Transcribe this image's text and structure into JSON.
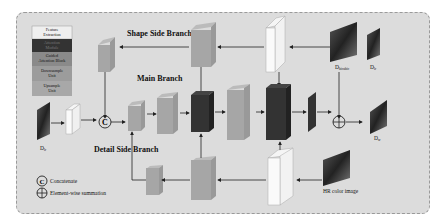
{
  "legend": {
    "items": [
      {
        "label_lines": [
          "Feature",
          "Extraction"
        ],
        "color": "#efefef",
        "text_color": "#111111"
      },
      {
        "label_lines": [
          "Attention",
          "Module"
        ],
        "color": "#333333",
        "text_color": "#777777"
      },
      {
        "label_lines": [
          "Guided",
          "Attention Block"
        ],
        "color": "#8a8a8a",
        "text_color": "#111111"
      },
      {
        "label_lines": [
          "Downsample",
          "Unit"
        ],
        "color": "#9c9c9c",
        "text_color": "#111111"
      },
      {
        "label_lines": [
          "Upsample",
          "Unit"
        ],
        "color": "#a8a8a8",
        "text_color": "#111111"
      }
    ]
  },
  "branches": {
    "shape": "Shape Side Branch",
    "main": "Main Branch",
    "detail": "Detail Side Branch"
  },
  "images": {
    "input": "D",
    "input_sub": "lr",
    "bicubic": "D",
    "bicubic_sub": "bicubic",
    "lr_top": "D",
    "lr_top_sub": "lr",
    "output": "D",
    "output_sub": "sr",
    "hr_color": "HR color image"
  },
  "symbols": {
    "concatenate_glyph": "C",
    "concatenate_label": "Concatenate",
    "sum_label": "Element-wise summation"
  },
  "colors": {
    "panel_bg": "#dcdcdc",
    "attention": "#333333",
    "gray_block": "#a6a6a6",
    "light_block": "#f2f2f2",
    "arrow": "#222222"
  }
}
